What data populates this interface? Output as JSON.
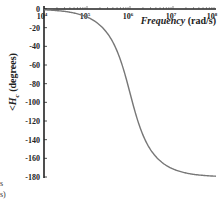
{
  "chart_data": {
    "type": "line",
    "title": "",
    "xlabel": "Frequency (rad/s)",
    "ylabel": "<H_c (degrees)",
    "xscale": "log",
    "xlim": [
      10000,
      100000000
    ],
    "ylim": [
      -180,
      0
    ],
    "x_ticks": [
      "10^4",
      "10^5",
      "10^6",
      "10^7",
      "10^8"
    ],
    "y_ticks": [
      0,
      -20,
      -40,
      -60,
      -80,
      -100,
      -120,
      -140,
      -160,
      -180
    ],
    "grid": false,
    "legend": null,
    "series": [
      {
        "name": "phase",
        "color": "#777777",
        "x": [
          10000,
          31623,
          100000,
          177828,
          316228,
          562341,
          1000000,
          1778279,
          3162278,
          5623413,
          10000000,
          31622777,
          100000000
        ],
        "values": [
          -1.2,
          -3.6,
          -11.4,
          -20.3,
          -38,
          -62,
          -90,
          -118,
          -142,
          -160,
          -168.6,
          -176.4,
          -178.8
        ]
      }
    ],
    "annotations": []
  },
  "labels": {
    "ylabel_main": "<H",
    "ylabel_sub": "c",
    "ylabel_tail": " (degrees)",
    "xlabel_italic": "Frequency",
    "xlabel_units": " (rad/s)",
    "x_tick_base": "10",
    "x_tick_exps": [
      "4",
      "5",
      "6",
      "7",
      "8"
    ],
    "y_ticks": [
      "0",
      "-20",
      "-40",
      "-60",
      "-80",
      "-100",
      "-120",
      "-140",
      "-160",
      "-180"
    ],
    "remnant_top": "s",
    "remnant_bottom": "s)"
  }
}
